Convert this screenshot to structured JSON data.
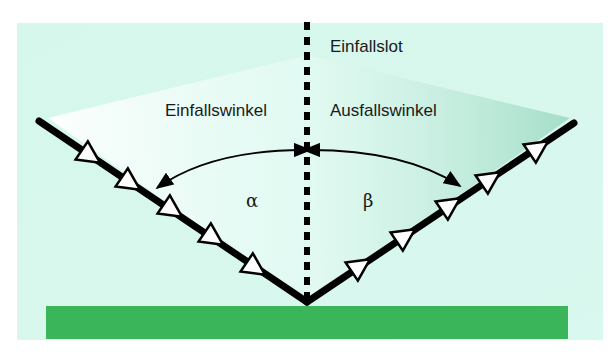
{
  "diagram": {
    "labels": {
      "normal": "Einfallslot",
      "incidence_angle": "Einfallswinkel",
      "reflection_angle": "Ausfallswinkel",
      "alpha": "α",
      "beta": "β"
    },
    "colors": {
      "background_panel": "#d8f7ec",
      "surface": "#3bb55a",
      "ray": "#000000",
      "arrowhead_fill": "#ffffff"
    }
  }
}
